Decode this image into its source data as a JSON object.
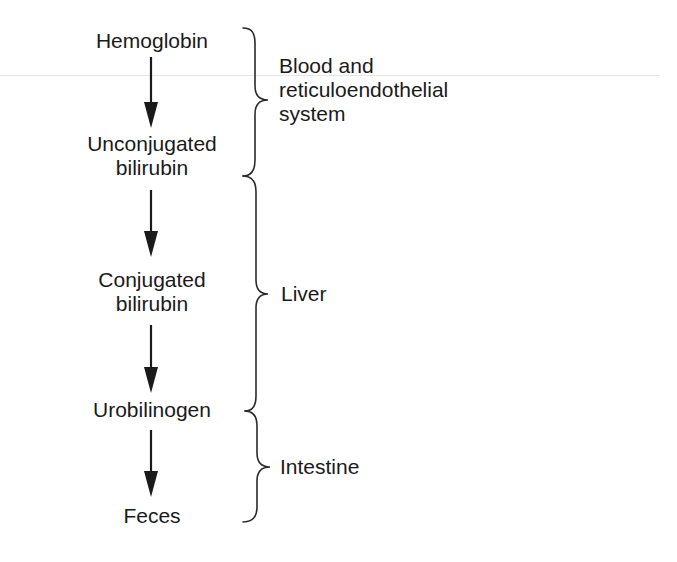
{
  "diagram": {
    "type": "flow",
    "direction": "top-to-bottom",
    "stages": [
      {
        "id": "hemoglobin",
        "lines": [
          "Hemoglobin"
        ]
      },
      {
        "id": "unconjugated-bilirubin",
        "lines": [
          "Unconjugated",
          "bilirubin"
        ]
      },
      {
        "id": "conjugated-bilirubin",
        "lines": [
          "Conjugated",
          "bilirubin"
        ]
      },
      {
        "id": "urobilinogen",
        "lines": [
          "Urobilinogen"
        ]
      },
      {
        "id": "feces",
        "lines": [
          "Feces"
        ]
      }
    ],
    "arrows": [
      {
        "from": "hemoglobin",
        "to": "unconjugated-bilirubin"
      },
      {
        "from": "unconjugated-bilirubin",
        "to": "conjugated-bilirubin"
      },
      {
        "from": "conjugated-bilirubin",
        "to": "urobilinogen"
      },
      {
        "from": "urobilinogen",
        "to": "feces"
      }
    ],
    "regions": [
      {
        "id": "blood-res",
        "lines": [
          "Blood and",
          "reticuloendothelial",
          "system"
        ],
        "spans": [
          "hemoglobin",
          "unconjugated-bilirubin"
        ]
      },
      {
        "id": "liver",
        "lines": [
          "Liver"
        ],
        "spans": [
          "unconjugated-bilirubin",
          "urobilinogen"
        ]
      },
      {
        "id": "intestine",
        "lines": [
          "Intestine"
        ],
        "spans": [
          "urobilinogen",
          "feces"
        ]
      }
    ],
    "colors": {
      "ink": "#1a1a1a",
      "brace": "#2a2a2a",
      "rule": "#e6e6e6",
      "background": "#ffffff"
    }
  }
}
